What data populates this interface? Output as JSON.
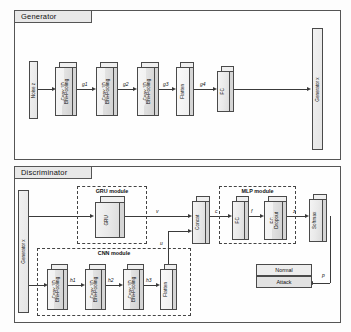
{
  "generator": {
    "panel_title": "Generator",
    "input": {
      "label": "Noise z"
    },
    "output": {
      "label": "Generator x"
    },
    "blocks": [
      {
        "id": "g-conv1",
        "front": "Conv 1D",
        "back": "BN+Pooling"
      },
      {
        "id": "g-conv2",
        "front": "Conv 1D",
        "back": "BN+Pooling"
      },
      {
        "id": "g-conv3",
        "front": "Conv 1D",
        "back": "BN+Pooling"
      },
      {
        "id": "g-flatten",
        "front": "Flatten",
        "back": ""
      },
      {
        "id": "g-fc",
        "front": "FC",
        "back": ""
      }
    ],
    "edges": [
      {
        "id": "g1",
        "label": "g1"
      },
      {
        "id": "g2",
        "label": "g2"
      },
      {
        "id": "g3",
        "label": "g3"
      },
      {
        "id": "g4",
        "label": "g4"
      }
    ]
  },
  "discriminator": {
    "panel_title": "Discriminator",
    "input": {
      "label": "Generator x"
    },
    "gru_module": {
      "title": "GRU module",
      "block": {
        "front": "GRU",
        "back": ""
      }
    },
    "cnn_module": {
      "title": "CNN module",
      "blocks": [
        {
          "id": "d-conv1",
          "front": "Conv 1D",
          "back": "BN+Pooling"
        },
        {
          "id": "d-conv2",
          "front": "Conv 1D",
          "back": "BN+Pooling"
        },
        {
          "id": "d-conv3",
          "front": "Conv 1D",
          "back": "BN+Pooling"
        },
        {
          "id": "d-flatten",
          "front": "Flatten",
          "back": ""
        }
      ],
      "edges": [
        {
          "id": "h1",
          "label": "h1"
        },
        {
          "id": "h2",
          "label": "h2"
        },
        {
          "id": "h3",
          "label": "h3"
        }
      ]
    },
    "concat": {
      "front": "Concat",
      "back": ""
    },
    "mlp_module": {
      "title": "MLP module",
      "blocks": [
        {
          "id": "d-fc1",
          "front": "FC",
          "back": ""
        },
        {
          "id": "d-fc2",
          "front": "FC",
          "back": "Dropout"
        }
      ]
    },
    "softmax": {
      "front": "Softmax",
      "back": ""
    },
    "outputs": [
      {
        "id": "normal",
        "label": "Normal"
      },
      {
        "id": "attack",
        "label": "Attack"
      }
    ],
    "edges": [
      {
        "id": "v",
        "label": "v"
      },
      {
        "id": "u",
        "label": "u"
      },
      {
        "id": "c",
        "label": "c"
      },
      {
        "id": "f",
        "label": "f"
      },
      {
        "id": "z",
        "label": "z"
      },
      {
        "id": "p",
        "label": "p"
      }
    ]
  }
}
